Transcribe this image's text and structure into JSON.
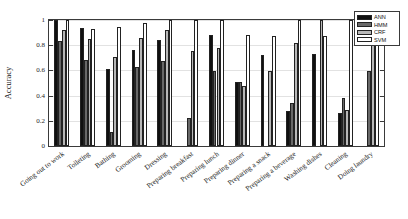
{
  "chart_data": {
    "type": "bar",
    "title": "",
    "xlabel": "",
    "ylabel": "Accuracy",
    "ylim": [
      0,
      1
    ],
    "yticks": [
      "0",
      "0.2",
      "0.4",
      "0.6",
      "0.8",
      "1"
    ],
    "ytick_values": [
      0,
      0.2,
      0.4,
      0.6,
      0.8,
      1
    ],
    "grid": true,
    "legend_position": "top-right",
    "categories": [
      "Going out to work",
      "Toileting",
      "Bathing",
      "Grooming",
      "Dressing",
      "Preparing breakfast",
      "Preparing lunch",
      "Preparing dinner",
      "Preparing a snack",
      "Preparing a beverage",
      "Washing dishes",
      "Cleaning",
      "Doing laundry"
    ],
    "series": [
      {
        "name": "ANN",
        "color": "#101010",
        "values": [
          1.0,
          0.94,
          0.61,
          0.76,
          0.84,
          0.0,
          0.885,
          0.51,
          0.725,
          0.275,
          0.73,
          0.26,
          0.0
        ]
      },
      {
        "name": "HMM",
        "color": "#686868",
        "values": [
          0.835,
          0.685,
          0.115,
          0.625,
          0.675,
          0.22,
          0.595,
          0.505,
          0.0,
          0.345,
          0.0,
          0.385,
          0.595
        ]
      },
      {
        "name": "CRF",
        "color": "#b8b8b8",
        "values": [
          0.92,
          0.848,
          0.71,
          0.855,
          0.92,
          0.755,
          0.78,
          0.475,
          0.595,
          0.815,
          1.0,
          0.285,
          0.86
        ]
      },
      {
        "name": "SVM",
        "color": "#ffffff",
        "values": [
          1.0,
          0.928,
          0.945,
          0.975,
          1.0,
          1.0,
          1.0,
          0.885,
          0.87,
          1.0,
          0.87,
          1.0,
          1.0
        ]
      }
    ]
  },
  "legend": {
    "items": [
      "ANN",
      "HMM",
      "CRF",
      "SVM"
    ]
  }
}
